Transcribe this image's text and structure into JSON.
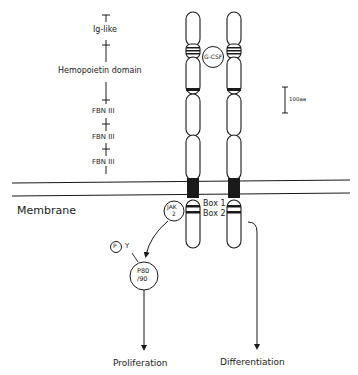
{
  "domains": {
    "items": [
      "Ig-like",
      "Hemopoietin  domain",
      "FBN  III",
      "FBN  III",
      "FBN  III"
    ]
  },
  "ligand": {
    "label": "G-CSF"
  },
  "scale_bar": {
    "label": "100aa"
  },
  "membrane": {
    "label": "Membrane"
  },
  "intracellular": {
    "box1": "Box 1",
    "box2": "Box 2",
    "jak": {
      "line1": "JAK",
      "line2": "2"
    },
    "phospho": {
      "circle": "P",
      "residue": "Y"
    },
    "p80": {
      "line1": "P80",
      "line2": "/90"
    }
  },
  "outcomes": {
    "left": "Proliferation",
    "right": "Differentiation"
  },
  "colors": {
    "stroke": "#1a1a1a",
    "background": "#ffffff"
  }
}
